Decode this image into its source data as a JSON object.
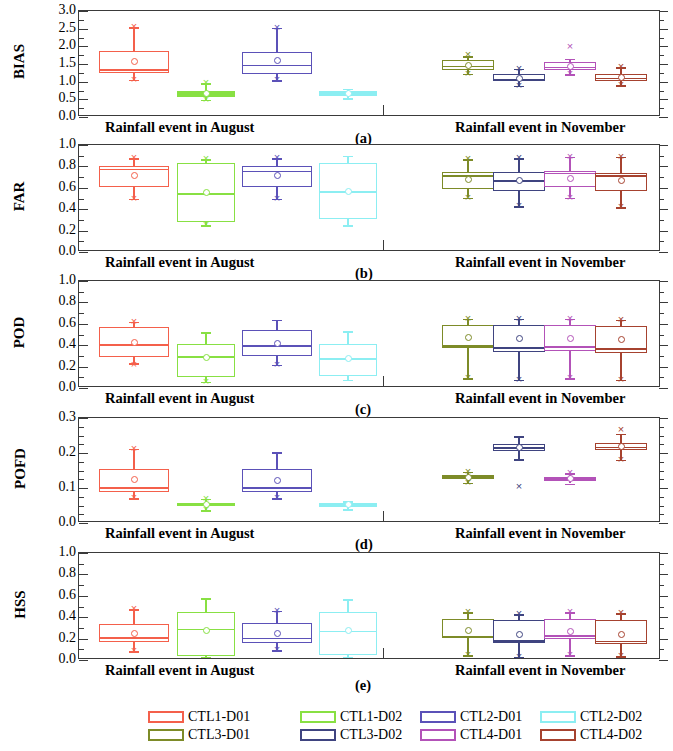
{
  "figure": {
    "width": 673,
    "height": 751,
    "group_labels": {
      "left": "Rainfall event in August",
      "right": "Rainfall event in November"
    },
    "panel_letters": [
      "(a)",
      "(b)",
      "(c)",
      "(d)",
      "(e)"
    ]
  },
  "legend": {
    "position": "bottom",
    "entries": [
      {
        "label": "CTL1-D01",
        "color": "#f4604b"
      },
      {
        "label": "CTL1-D02",
        "color": "#88e043"
      },
      {
        "label": "CTL2-D01",
        "color": "#5b51b8"
      },
      {
        "label": "CTL2-D02",
        "color": "#8ceef2"
      },
      {
        "label": "CTL3-D01",
        "color": "#7d8b28"
      },
      {
        "label": "CTL3-D02",
        "color": "#3f4480"
      },
      {
        "label": "CTL4-D01",
        "color": "#b352b8"
      },
      {
        "label": "CTL4-D02",
        "color": "#a6422f"
      }
    ]
  },
  "chart_data": [
    {
      "type": "box",
      "panel": "(a)",
      "ylabel": "BIAS",
      "ylim": [
        0.0,
        3.0
      ],
      "yticks": [
        0.0,
        0.5,
        1.0,
        1.5,
        2.0,
        2.5,
        3.0
      ],
      "ytick_labels": [
        "0.0",
        "0.5",
        "1.0",
        "1.5",
        "2.0",
        "2.5",
        "3.0"
      ],
      "yminor_step": 0.25,
      "grid": false,
      "xlabel": "",
      "groups": [
        {
          "name": "Rainfall event in August",
          "boxes": [
            {
              "series": "CTL1-D01",
              "q1": 1.22,
              "median": 1.33,
              "q3": 1.84,
              "mean": 1.55,
              "whisker_low": 1.03,
              "whisker_high": 2.52,
              "outliers": [
                1.03,
                2.52
              ]
            },
            {
              "series": "CTL1-D02",
              "q1": 0.55,
              "median": 0.62,
              "q3": 0.7,
              "mean": 0.63,
              "whisker_low": 0.46,
              "whisker_high": 0.93,
              "outliers": [
                0.46,
                0.93
              ]
            },
            {
              "series": "CTL2-D01",
              "q1": 1.2,
              "median": 1.45,
              "q3": 1.82,
              "mean": 1.56,
              "whisker_low": 1.02,
              "whisker_high": 2.5,
              "outliers": [
                1.02,
                2.5
              ]
            },
            {
              "series": "CTL2-D02",
              "q1": 0.56,
              "median": 0.64,
              "q3": 0.72,
              "mean": 0.65,
              "whisker_low": 0.5,
              "whisker_high": 0.77,
              "outliers": []
            }
          ]
        },
        {
          "name": "Rainfall event in November",
          "boxes": [
            {
              "series": "CTL3-D01",
              "q1": 1.3,
              "median": 1.42,
              "q3": 1.58,
              "mean": 1.44,
              "whisker_low": 1.2,
              "whisker_high": 1.7,
              "outliers": [
                1.2,
                1.72
              ]
            },
            {
              "series": "CTL3-D02",
              "q1": 0.98,
              "median": 1.06,
              "q3": 1.18,
              "mean": 1.07,
              "whisker_low": 0.86,
              "whisker_high": 1.34,
              "outliers": [
                0.86,
                1.34
              ]
            },
            {
              "series": "CTL4-D01",
              "q1": 1.3,
              "median": 1.4,
              "q3": 1.52,
              "mean": 1.41,
              "whisker_low": 1.18,
              "whisker_high": 1.62,
              "outliers": [
                1.18,
                1.95
              ]
            },
            {
              "series": "CTL4-D02",
              "q1": 0.98,
              "median": 1.08,
              "q3": 1.2,
              "mean": 1.1,
              "whisker_low": 0.88,
              "whisker_high": 1.38,
              "outliers": [
                0.88,
                1.38
              ]
            }
          ]
        }
      ]
    },
    {
      "type": "box",
      "panel": "(b)",
      "ylabel": "FAR",
      "ylim": [
        0.0,
        1.0
      ],
      "yticks": [
        0.0,
        0.2,
        0.4,
        0.6,
        0.8,
        1.0
      ],
      "ytick_labels": [
        "0.0",
        "0.2",
        "0.4",
        "0.6",
        "0.8",
        "1.0"
      ],
      "yminor_step": 0.1,
      "grid": false,
      "xlabel": "",
      "groups": [
        {
          "name": "Rainfall event in August",
          "boxes": [
            {
              "series": "CTL1-D01",
              "q1": 0.6,
              "median": 0.77,
              "q3": 0.79,
              "mean": 0.71,
              "whisker_low": 0.49,
              "whisker_high": 0.87,
              "outliers": [
                0.49,
                0.87
              ]
            },
            {
              "series": "CTL1-D02",
              "q1": 0.27,
              "median": 0.54,
              "q3": 0.82,
              "mean": 0.55,
              "whisker_low": 0.24,
              "whisker_high": 0.86,
              "outliers": [
                0.24,
                0.86
              ]
            },
            {
              "series": "CTL2-D01",
              "q1": 0.6,
              "median": 0.75,
              "q3": 0.79,
              "mean": 0.71,
              "whisker_low": 0.49,
              "whisker_high": 0.87,
              "outliers": [
                0.49,
                0.87
              ]
            },
            {
              "series": "CTL2-D02",
              "q1": 0.3,
              "median": 0.56,
              "q3": 0.82,
              "mean": 0.56,
              "whisker_low": 0.24,
              "whisker_high": 0.89,
              "outliers": []
            }
          ]
        },
        {
          "name": "Rainfall event in November",
          "boxes": [
            {
              "series": "CTL3-D01",
              "q1": 0.58,
              "median": 0.71,
              "q3": 0.74,
              "mean": 0.67,
              "whisker_low": 0.5,
              "whisker_high": 0.86,
              "outliers": [
                0.5,
                0.86
              ]
            },
            {
              "series": "CTL3-D02",
              "q1": 0.56,
              "median": 0.66,
              "q3": 0.74,
              "mean": 0.66,
              "whisker_low": 0.42,
              "whisker_high": 0.87,
              "outliers": [
                0.42,
                0.87
              ]
            },
            {
              "series": "CTL4-D01",
              "q1": 0.6,
              "median": 0.73,
              "q3": 0.75,
              "mean": 0.68,
              "whisker_low": 0.5,
              "whisker_high": 0.88,
              "outliers": [
                0.5,
                0.88
              ]
            },
            {
              "series": "CTL4-D02",
              "q1": 0.56,
              "median": 0.71,
              "q3": 0.73,
              "mean": 0.66,
              "whisker_low": 0.41,
              "whisker_high": 0.88,
              "outliers": [
                0.41,
                0.88
              ]
            }
          ]
        }
      ]
    },
    {
      "type": "box",
      "panel": "(c)",
      "ylabel": "POD",
      "ylim": [
        0.0,
        1.0
      ],
      "yticks": [
        0.0,
        0.2,
        0.4,
        0.6,
        0.8,
        1.0
      ],
      "ytick_labels": [
        "0.0",
        "0.2",
        "0.4",
        "0.6",
        "0.8",
        "1.0"
      ],
      "yminor_step": 0.1,
      "grid": false,
      "xlabel": "",
      "groups": [
        {
          "name": "Rainfall event in August",
          "boxes": [
            {
              "series": "CTL1-D01",
              "q1": 0.28,
              "median": 0.4,
              "q3": 0.56,
              "mean": 0.42,
              "whisker_low": 0.22,
              "whisker_high": 0.61,
              "outliers": [
                0.21,
                0.61
              ]
            },
            {
              "series": "CTL1-D02",
              "q1": 0.09,
              "median": 0.29,
              "q3": 0.4,
              "mean": 0.28,
              "whisker_low": 0.05,
              "whisker_high": 0.51,
              "outliers": [
                0.05
              ]
            },
            {
              "series": "CTL2-D01",
              "q1": 0.29,
              "median": 0.39,
              "q3": 0.53,
              "mean": 0.41,
              "whisker_low": 0.21,
              "whisker_high": 0.63,
              "outliers": [
                0.21
              ]
            },
            {
              "series": "CTL2-D02",
              "q1": 0.1,
              "median": 0.27,
              "q3": 0.4,
              "mean": 0.27,
              "whisker_low": 0.07,
              "whisker_high": 0.52,
              "outliers": []
            }
          ]
        },
        {
          "name": "Rainfall event in November",
          "boxes": [
            {
              "series": "CTL3-D01",
              "q1": 0.36,
              "median": 0.39,
              "q3": 0.58,
              "mean": 0.46,
              "whisker_low": 0.08,
              "whisker_high": 0.64,
              "outliers": [
                0.08,
                0.64
              ]
            },
            {
              "series": "CTL3-D02",
              "q1": 0.33,
              "median": 0.37,
              "q3": 0.58,
              "mean": 0.45,
              "whisker_low": 0.07,
              "whisker_high": 0.64,
              "outliers": [
                0.07,
                0.64
              ]
            },
            {
              "series": "CTL4-D01",
              "q1": 0.34,
              "median": 0.38,
              "q3": 0.58,
              "mean": 0.45,
              "whisker_low": 0.08,
              "whisker_high": 0.64,
              "outliers": [
                0.08,
                0.64
              ]
            },
            {
              "series": "CTL4-D02",
              "q1": 0.32,
              "median": 0.36,
              "q3": 0.57,
              "mean": 0.44,
              "whisker_low": 0.07,
              "whisker_high": 0.63,
              "outliers": [
                0.07,
                0.63
              ]
            }
          ]
        }
      ]
    },
    {
      "type": "box",
      "panel": "(d)",
      "ylabel": "POFD",
      "ylim": [
        0.0,
        0.3
      ],
      "yticks": [
        0.0,
        0.1,
        0.2,
        0.3
      ],
      "ytick_labels": [
        "0.0",
        "0.1",
        "0.2",
        "0.3"
      ],
      "yminor_step": 0.025,
      "grid": false,
      "xlabel": "",
      "groups": [
        {
          "name": "Rainfall event in August",
          "boxes": [
            {
              "series": "CTL1-D01",
              "q1": 0.087,
              "median": 0.1,
              "q3": 0.152,
              "mean": 0.121,
              "whisker_low": 0.068,
              "whisker_high": 0.209,
              "outliers": [
                0.068,
                0.209
              ]
            },
            {
              "series": "CTL1-D02",
              "q1": 0.046,
              "median": 0.05,
              "q3": 0.054,
              "mean": 0.05,
              "whisker_low": 0.034,
              "whisker_high": 0.066,
              "outliers": [
                0.034,
                0.066
              ]
            },
            {
              "series": "CTL2-D01",
              "q1": 0.086,
              "median": 0.1,
              "q3": 0.152,
              "mean": 0.12,
              "whisker_low": 0.068,
              "whisker_high": 0.2,
              "outliers": [
                0.068
              ]
            },
            {
              "series": "CTL2-D02",
              "q1": 0.044,
              "median": 0.05,
              "q3": 0.054,
              "mean": 0.049,
              "whisker_low": 0.036,
              "whisker_high": 0.06,
              "outliers": []
            }
          ]
        },
        {
          "name": "Rainfall event in November",
          "boxes": [
            {
              "series": "CTL3-D01",
              "q1": 0.122,
              "median": 0.128,
              "q3": 0.134,
              "mean": 0.128,
              "whisker_low": 0.112,
              "whisker_high": 0.144,
              "outliers": [
                0.112,
                0.144
              ]
            },
            {
              "series": "CTL3-D02",
              "q1": 0.203,
              "median": 0.213,
              "q3": 0.223,
              "mean": 0.213,
              "whisker_low": 0.18,
              "whisker_high": 0.245,
              "outliers": [
                0.1
              ]
            },
            {
              "series": "CTL4-D01",
              "q1": 0.118,
              "median": 0.122,
              "q3": 0.128,
              "mean": 0.123,
              "whisker_low": 0.11,
              "whisker_high": 0.14,
              "outliers": [
                0.14
              ]
            },
            {
              "series": "CTL4-D02",
              "q1": 0.205,
              "median": 0.215,
              "q3": 0.225,
              "mean": 0.215,
              "whisker_low": 0.178,
              "whisker_high": 0.252,
              "outliers": [
                0.178,
                0.262
              ]
            }
          ]
        }
      ]
    },
    {
      "type": "box",
      "panel": "(e)",
      "ylabel": "HSS",
      "ylim": [
        0.0,
        1.0
      ],
      "yticks": [
        0.0,
        0.2,
        0.4,
        0.6,
        0.8,
        1.0
      ],
      "ytick_labels": [
        "0.0",
        "0.2",
        "0.4",
        "0.6",
        "0.8",
        "1.0"
      ],
      "yminor_step": 0.1,
      "grid": false,
      "xlabel": "",
      "groups": [
        {
          "name": "Rainfall event in August",
          "boxes": [
            {
              "series": "CTL1-D01",
              "q1": 0.155,
              "median": 0.205,
              "q3": 0.325,
              "mean": 0.235,
              "whisker_low": 0.075,
              "whisker_high": 0.465,
              "outliers": [
                0.075,
                0.465
              ]
            },
            {
              "series": "CTL1-D02",
              "q1": 0.03,
              "median": 0.285,
              "q3": 0.44,
              "mean": 0.265,
              "whisker_low": 0.02,
              "whisker_high": 0.57,
              "outliers": []
            },
            {
              "series": "CTL2-D01",
              "q1": 0.15,
              "median": 0.2,
              "q3": 0.335,
              "mean": 0.235,
              "whisker_low": 0.08,
              "whisker_high": 0.45,
              "outliers": [
                0.08,
                0.45
              ]
            },
            {
              "series": "CTL2-D02",
              "q1": 0.035,
              "median": 0.265,
              "q3": 0.44,
              "mean": 0.265,
              "whisker_low": 0.02,
              "whisker_high": 0.56,
              "outliers": []
            }
          ]
        },
        {
          "name": "Rainfall event in November",
          "boxes": [
            {
              "series": "CTL3-D01",
              "q1": 0.2,
              "median": 0.215,
              "q3": 0.375,
              "mean": 0.265,
              "whisker_low": 0.035,
              "whisker_high": 0.44,
              "outliers": [
                0.035,
                0.44
              ]
            },
            {
              "series": "CTL3-D02",
              "q1": 0.145,
              "median": 0.175,
              "q3": 0.36,
              "mean": 0.225,
              "whisker_low": 0.02,
              "whisker_high": 0.42,
              "outliers": [
                0.02,
                0.42
              ]
            },
            {
              "series": "CTL4-D01",
              "q1": 0.185,
              "median": 0.225,
              "q3": 0.375,
              "mean": 0.255,
              "whisker_low": 0.035,
              "whisker_high": 0.435,
              "outliers": [
                0.035,
                0.435
              ]
            },
            {
              "series": "CTL4-D02",
              "q1": 0.14,
              "median": 0.17,
              "q3": 0.36,
              "mean": 0.225,
              "whisker_low": 0.025,
              "whisker_high": 0.43,
              "outliers": [
                0.025,
                0.43
              ]
            }
          ]
        }
      ]
    }
  ]
}
